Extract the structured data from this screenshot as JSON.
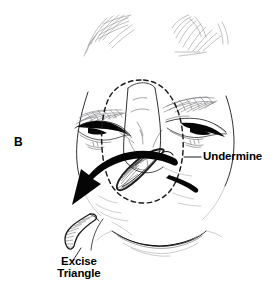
{
  "figure": {
    "panel_letter": "B",
    "background_color": "#ffffff",
    "ink_color": "#1a1a1a"
  },
  "annotations": {
    "undermine": {
      "label": "Undermine",
      "leader_line": "horizontal-leader-line",
      "points_to": "dashed-undermining-outline"
    },
    "excise": {
      "label_line1": "Excise",
      "label_line2": "Triangle",
      "leader_line": "diagonal-leader-line",
      "points_to": "excised-triangle-wedge"
    }
  },
  "elements": {
    "dashed_outline": "dashed-undermining-outline",
    "transfer_arrow": "curved-transfer-arrow",
    "excised_wedge": "excised-triangle-wedge",
    "alar_flap": "alar-base-flap",
    "left_eye": "left-eye",
    "right_eye": "right-eye",
    "left_brow": "left-eyebrow",
    "right_brow": "right-eyebrow",
    "hair_left": "hair-strand-left",
    "hair_right": "hair-strand-right",
    "mouth": "upper-lip-mouth",
    "nose": "nose-outline"
  }
}
